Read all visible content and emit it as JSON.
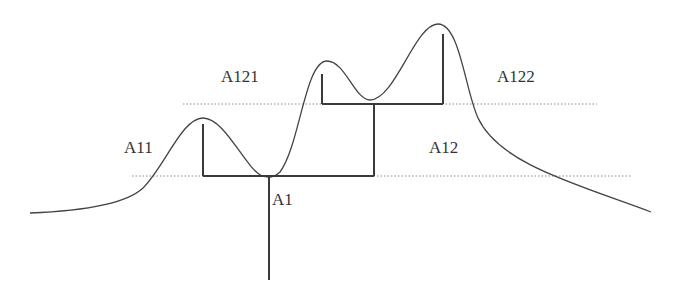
{
  "diagram": {
    "title": "",
    "labels": {
      "a1": "A1",
      "a11": "A11",
      "a12": "A12",
      "a121": "A121",
      "a122": "A122"
    },
    "tree_structure": {
      "root": "A1",
      "children": [
        {
          "name": "A11",
          "children": []
        },
        {
          "name": "A12",
          "children": [
            {
              "name": "A121",
              "children": []
            },
            {
              "name": "A122",
              "children": []
            }
          ]
        }
      ]
    },
    "threshold_levels": [
      "lower",
      "upper"
    ],
    "peaks": [
      "A11",
      "A121",
      "A122"
    ]
  }
}
